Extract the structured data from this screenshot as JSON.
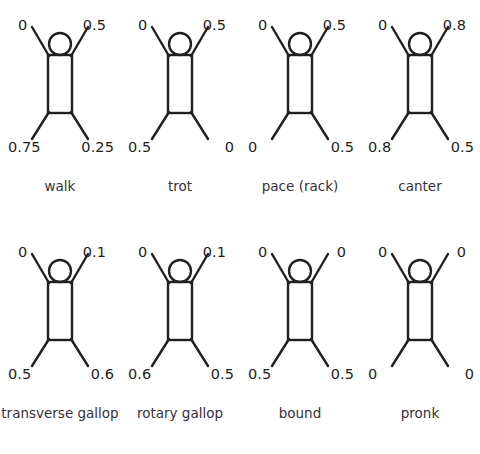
{
  "figure": {
    "background_color": "#ffffff",
    "stroke_color": "#231f20",
    "text_color": "#231f20",
    "label_color": "#353238",
    "columns": 4,
    "rows": 2
  },
  "legend": {
    "limb_order": [
      "front-left",
      "front-right",
      "hind-left",
      "hind-right"
    ],
    "note": "numbers are relative phase of each limb"
  },
  "gaits": [
    {
      "name": "walk",
      "label": "walk",
      "phases": {
        "front_left": "0",
        "front_right": "0.5",
        "hind_left": "0.75",
        "hind_right": "0.25"
      }
    },
    {
      "name": "trot",
      "label": "trot",
      "phases": {
        "front_left": "0",
        "front_right": "0.5",
        "hind_left": "0.5",
        "hind_right": "0"
      }
    },
    {
      "name": "pace-rack",
      "label": "pace (rack)",
      "phases": {
        "front_left": "0",
        "front_right": "0.5",
        "hind_left": "0",
        "hind_right": "0.5"
      }
    },
    {
      "name": "canter",
      "label": "canter",
      "phases": {
        "front_left": "0",
        "front_right": "0.8",
        "hind_left": "0.8",
        "hind_right": "0.5"
      }
    },
    {
      "name": "transverse-gallop",
      "label": "transverse gallop",
      "phases": {
        "front_left": "0",
        "front_right": "0.1",
        "hind_left": "0.5",
        "hind_right": "0.6"
      }
    },
    {
      "name": "rotary-gallop",
      "label": "rotary gallop",
      "phases": {
        "front_left": "0",
        "front_right": "0.1",
        "hind_left": "0.6",
        "hind_right": "0.5"
      }
    },
    {
      "name": "bound",
      "label": "bound",
      "phases": {
        "front_left": "0",
        "front_right": "0",
        "hind_left": "0.5",
        "hind_right": "0.5"
      }
    },
    {
      "name": "pronk",
      "label": "pronk",
      "phases": {
        "front_left": "0",
        "front_right": "0",
        "hind_left": "0",
        "hind_right": "0"
      }
    }
  ]
}
